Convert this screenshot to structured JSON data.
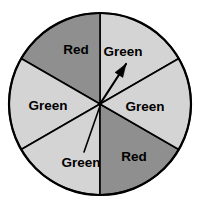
{
  "figure": {
    "name": "spinner-wheel",
    "background_color": "#ffffff",
    "outline_color": "#000000",
    "center_x": 100,
    "center_y": 104,
    "radius": 91
  },
  "colors": {
    "green_fill": "#d4d4d4",
    "red_fill": "#8f8f8f",
    "outline": "#000000",
    "text": "#000000"
  },
  "chart_data": {
    "type": "pie",
    "title": "",
    "categories": [
      "Green",
      "Red",
      "Green",
      "Green",
      "Red",
      "Green"
    ],
    "values": [
      60,
      60,
      60,
      60,
      60,
      60
    ],
    "unit": "degrees",
    "legend": "none",
    "grid": false
  },
  "sectors": [
    {
      "id": "sector-top-right",
      "label": "Green",
      "fill_key": "green_fill",
      "start_angle": 30,
      "end_angle": 90,
      "label_x": 123,
      "label_y": 52
    },
    {
      "id": "sector-top-left",
      "label": "Red",
      "fill_key": "red_fill",
      "start_angle": 90,
      "end_angle": 150,
      "label_x": 76,
      "label_y": 50
    },
    {
      "id": "sector-left",
      "label": "Green",
      "fill_key": "green_fill",
      "start_angle": 150,
      "end_angle": 210,
      "label_x": 48,
      "label_y": 106
    },
    {
      "id": "sector-bottom-left",
      "label": "Green",
      "fill_key": "green_fill",
      "start_angle": 210,
      "end_angle": 270,
      "label_x": 81,
      "label_y": 163
    },
    {
      "id": "sector-bottom-right",
      "label": "Red",
      "fill_key": "red_fill",
      "start_angle": 270,
      "end_angle": 330,
      "label_x": 134,
      "label_y": 157
    },
    {
      "id": "sector-right",
      "label": "Green",
      "fill_key": "green_fill",
      "start_angle": 330,
      "end_angle": 390,
      "label_x": 145,
      "label_y": 107
    }
  ],
  "pointer": {
    "name": "spinner-arrow",
    "tail_x": 100,
    "tail_y": 104,
    "tip_x": 126,
    "tip_y": 64,
    "angle_degrees": 57
  },
  "leader": {
    "name": "label-leader-line",
    "from_x": 100,
    "from_y": 106,
    "to_x": 84,
    "to_y": 152
  }
}
